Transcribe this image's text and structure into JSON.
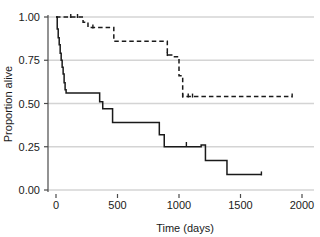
{
  "chart_data": {
    "type": "line",
    "title": "",
    "xlabel": "Time (days)",
    "ylabel": "Proportion alive",
    "xlim": [
      -60,
      2060
    ],
    "ylim": [
      0.0,
      1.0
    ],
    "xticks": [
      0,
      500,
      1000,
      1500,
      2000
    ],
    "xtick_labels": [
      "0",
      "500",
      "1000",
      "1500",
      "2000"
    ],
    "yticks": [
      0.0,
      0.25,
      0.5,
      0.75,
      1.0
    ],
    "ytick_labels": [
      "0.00",
      "0.25",
      "0.50",
      "0.75",
      "1.00"
    ],
    "grid": "horizontal",
    "legend": "none",
    "series": [
      {
        "name": "solid-curve",
        "style": "solid",
        "color": "#1a1a1a",
        "step": "post",
        "x": [
          0,
          10,
          18,
          26,
          34,
          42,
          50,
          58,
          66,
          74,
          82,
          250,
          355,
          380,
          460,
          780,
          840,
          880,
          1060,
          1180,
          1215,
          1360,
          1390,
          1670
        ],
        "y": [
          1.0,
          0.93,
          0.88,
          0.84,
          0.79,
          0.75,
          0.71,
          0.67,
          0.62,
          0.58,
          0.56,
          0.56,
          0.51,
          0.47,
          0.39,
          0.39,
          0.32,
          0.25,
          0.25,
          0.26,
          0.17,
          0.17,
          0.09,
          0.09
        ],
        "censor_x": [
          1060,
          1670
        ],
        "censor_y": [
          0.26,
          0.09
        ]
      },
      {
        "name": "dashed-curve",
        "style": "dashed",
        "color": "#1a1a1a",
        "step": "post",
        "x": [
          0,
          120,
          175,
          220,
          260,
          300,
          450,
          470,
          880,
          905,
          950,
          985,
          1000,
          1030,
          1075,
          1110,
          1150,
          1920
        ],
        "y": [
          1.0,
          1.0,
          1.0,
          0.97,
          0.94,
          0.94,
          0.94,
          0.86,
          0.86,
          0.78,
          0.77,
          0.77,
          0.66,
          0.54,
          0.54,
          0.54,
          0.54,
          0.54
        ],
        "censor_x": [
          120,
          175,
          300,
          905,
          1030,
          1075,
          1110,
          1920
        ],
        "censor_y": [
          1.0,
          1.0,
          0.94,
          0.78,
          0.54,
          0.54,
          0.54,
          0.54
        ]
      }
    ]
  }
}
